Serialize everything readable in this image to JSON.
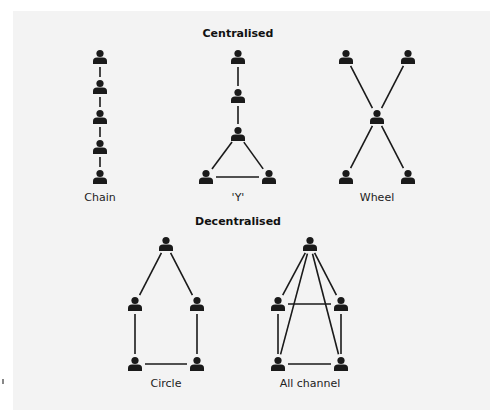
{
  "colors": {
    "background": "#f3f3f3",
    "ink": "#1a1a1a"
  },
  "sections": [
    {
      "title": "Centralised",
      "title_pos": [
        238,
        27
      ]
    },
    {
      "title": "Decentralised",
      "title_pos": [
        238,
        215
      ]
    }
  ],
  "networks": [
    {
      "label": "Chain",
      "label_pos": [
        100,
        191
      ],
      "nodes": [
        [
          100,
          57
        ],
        [
          100,
          87
        ],
        [
          100,
          117
        ],
        [
          100,
          147
        ],
        [
          100,
          177
        ]
      ],
      "edges": [
        [
          0,
          1
        ],
        [
          1,
          2
        ],
        [
          2,
          3
        ],
        [
          3,
          4
        ]
      ]
    },
    {
      "label": "'Y'",
      "label_pos": [
        238,
        191
      ],
      "nodes": [
        [
          238,
          57
        ],
        [
          238,
          96
        ],
        [
          238,
          134
        ],
        [
          206,
          177
        ],
        [
          269,
          177
        ]
      ],
      "edges": [
        [
          0,
          1
        ],
        [
          1,
          2
        ],
        [
          2,
          3
        ],
        [
          2,
          4
        ],
        [
          3,
          4
        ]
      ]
    },
    {
      "label": "Wheel",
      "label_pos": [
        377,
        191
      ],
      "nodes": [
        [
          346,
          57
        ],
        [
          408,
          57
        ],
        [
          377,
          117
        ],
        [
          346,
          177
        ],
        [
          408,
          177
        ]
      ],
      "edges": [
        [
          0,
          2
        ],
        [
          1,
          2
        ],
        [
          2,
          3
        ],
        [
          2,
          4
        ]
      ]
    },
    {
      "label": "Circle",
      "label_pos": [
        166,
        377
      ],
      "nodes": [
        [
          166,
          244
        ],
        [
          135,
          304
        ],
        [
          197,
          304
        ],
        [
          135,
          364
        ],
        [
          197,
          364
        ]
      ],
      "edges": [
        [
          0,
          1
        ],
        [
          0,
          2
        ],
        [
          1,
          3
        ],
        [
          2,
          4
        ],
        [
          3,
          4
        ]
      ]
    },
    {
      "label": "All channel",
      "label_pos": [
        310,
        377
      ],
      "nodes": [
        [
          310,
          244
        ],
        [
          278,
          304
        ],
        [
          341,
          304
        ],
        [
          278,
          364
        ],
        [
          341,
          364
        ]
      ],
      "edges": [
        [
          0,
          1
        ],
        [
          0,
          2
        ],
        [
          0,
          3
        ],
        [
          0,
          4
        ],
        [
          1,
          2
        ],
        [
          1,
          3
        ],
        [
          2,
          4
        ],
        [
          3,
          4
        ]
      ]
    }
  ],
  "icons": {
    "node": "person-icon"
  }
}
